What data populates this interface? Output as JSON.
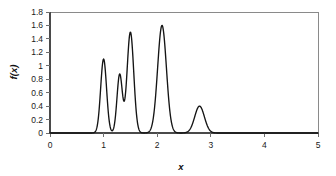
{
  "chart_data": {
    "type": "line",
    "title": "",
    "subtitle": "",
    "xlabel": "x",
    "ylabel": "f(x)",
    "xlim": [
      0,
      5
    ],
    "ylim": [
      0,
      1.8
    ],
    "grid": false,
    "legend": null,
    "legend_position": "none",
    "xticks": [
      "0",
      "1",
      "2",
      "3",
      "4",
      "5"
    ],
    "xtick_values": [
      0,
      1,
      2,
      3,
      4,
      5
    ],
    "yticks": [
      "0",
      "0.2",
      "0.4",
      "0.6",
      "0.8",
      "1",
      "1.2",
      "1.4",
      "1.6",
      "1.8"
    ],
    "ytick_values": [
      0,
      0.2,
      0.4,
      0.6,
      0.8,
      1.0,
      1.2,
      1.4,
      1.6,
      1.8
    ],
    "series": [
      {
        "name": "f(x)",
        "color": "#141414",
        "peaks": [
          {
            "center": 1.0,
            "height": 1.1,
            "width": 0.055
          },
          {
            "center": 1.3,
            "height": 0.87,
            "width": 0.05
          },
          {
            "center": 1.5,
            "height": 1.5,
            "width": 0.062
          },
          {
            "center": 2.09,
            "height": 1.6,
            "width": 0.082
          },
          {
            "center": 2.79,
            "height": 0.4,
            "width": 0.09
          }
        ],
        "x": [
          0.0,
          0.2,
          0.4,
          0.6,
          0.75,
          0.82,
          0.86,
          0.9,
          0.94,
          0.97,
          1.0,
          1.03,
          1.06,
          1.1,
          1.14,
          1.18,
          1.22,
          1.26,
          1.3,
          1.34,
          1.38,
          1.42,
          1.46,
          1.5,
          1.54,
          1.58,
          1.62,
          1.66,
          1.7,
          1.75,
          1.8,
          1.85,
          1.9,
          1.95,
          2.0,
          2.05,
          2.09,
          2.13,
          2.18,
          2.23,
          2.28,
          2.34,
          2.4,
          2.48,
          2.56,
          2.64,
          2.72,
          2.79,
          2.86,
          2.94,
          3.02,
          3.1,
          3.2,
          3.4,
          3.7,
          4.0,
          4.4,
          5.0
        ],
        "y": [
          0.0,
          0.0,
          0.0,
          0.0,
          0.01,
          0.03,
          0.08,
          0.28,
          0.72,
          1.02,
          1.1,
          1.01,
          0.72,
          0.28,
          0.09,
          0.09,
          0.27,
          0.65,
          0.87,
          0.73,
          0.67,
          0.9,
          1.34,
          1.5,
          1.36,
          0.98,
          0.57,
          0.25,
          0.09,
          0.02,
          0.01,
          0.03,
          0.12,
          0.4,
          0.92,
          1.4,
          1.6,
          1.52,
          1.19,
          0.78,
          0.44,
          0.2,
          0.08,
          0.03,
          0.06,
          0.19,
          0.36,
          0.4,
          0.34,
          0.19,
          0.07,
          0.02,
          0.01,
          0.0,
          0.0,
          0.0,
          0.0,
          0.0
        ]
      }
    ]
  },
  "axes": {
    "y_label_text": "f(x)",
    "x_label_text": "x"
  }
}
